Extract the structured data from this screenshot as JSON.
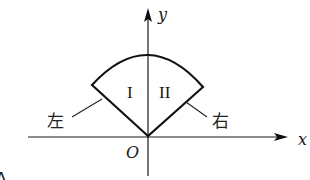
{
  "diagram": {
    "type": "coordinate-sector-figure",
    "axes": {
      "x_label": "x",
      "y_label": "y",
      "origin_label": "O"
    },
    "regions": {
      "left_region_label": "I",
      "right_region_label": "II"
    },
    "side_labels": {
      "left": "左",
      "right": "右"
    },
    "corner_label": "A",
    "colors": {
      "stroke": "#111111",
      "background": "#ffffff"
    }
  }
}
